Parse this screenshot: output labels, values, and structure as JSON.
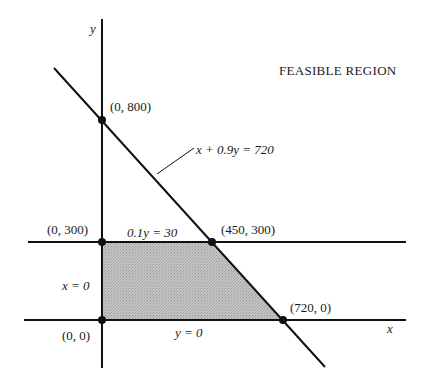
{
  "diagram": {
    "title": "FEASIBLE REGION",
    "axes": {
      "x_label": "x",
      "y_label": "y"
    },
    "constraints": [
      {
        "id": "c1",
        "label": "x + 0.9y = 720"
      },
      {
        "id": "c2",
        "label": "0.1y = 30"
      },
      {
        "id": "c3",
        "label": "x = 0"
      },
      {
        "id": "c4",
        "label": "y = 0"
      }
    ],
    "vertices": [
      {
        "label": "(0, 800)",
        "x": 0,
        "y": 800
      },
      {
        "label": "(0, 300)",
        "x": 0,
        "y": 300
      },
      {
        "label": "(450, 300)",
        "x": 450,
        "y": 300
      },
      {
        "label": "(720, 0)",
        "x": 720,
        "y": 0
      },
      {
        "label": "(0, 0)",
        "x": 0,
        "y": 0
      }
    ],
    "region": {
      "description": "Shaded feasible region bounded by x = 0, y = 0, 0.1y = 30, and x + 0.9y = 720",
      "polygon": [
        [
          0,
          0
        ],
        [
          0,
          300
        ],
        [
          450,
          300
        ],
        [
          720,
          0
        ]
      ],
      "fill_color": "#b8b8b8"
    },
    "colors": {
      "line": "#111111",
      "fill": "#b8b8b8"
    }
  }
}
